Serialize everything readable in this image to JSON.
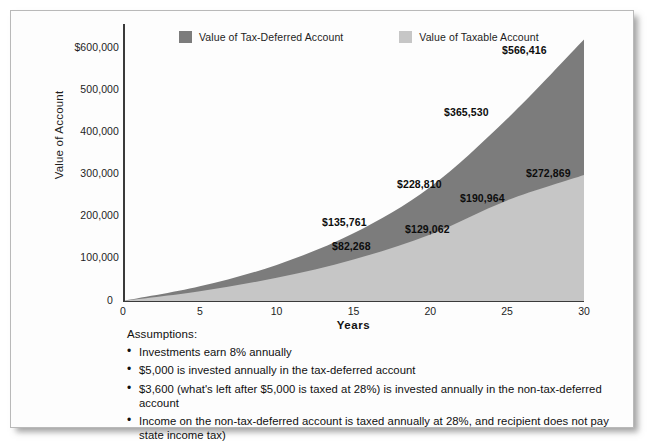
{
  "chart_data": {
    "type": "area",
    "title": "",
    "xlabel": "Years",
    "ylabel": "Value of Account",
    "xlim": [
      0,
      30
    ],
    "ylim": [
      0,
      600000
    ],
    "grid": false,
    "legend_position": "top",
    "x_ticks": [
      "0",
      "5",
      "10",
      "15",
      "20",
      "25",
      "30"
    ],
    "x_tick_values": [
      0,
      5,
      10,
      15,
      20,
      25,
      30
    ],
    "y_ticks": [
      "$600,000",
      "500,000",
      "400,000",
      "300,000",
      "200,000",
      "100,000",
      "0"
    ],
    "y_tick_values": [
      600000,
      500000,
      400000,
      300000,
      200000,
      100000,
      0
    ],
    "series": [
      {
        "name": "Value of Tax-Deferred Account",
        "color": "#7c7c7c",
        "x": [
          0,
          5,
          10,
          15,
          20,
          25,
          30
        ],
        "values": [
          0,
          31680,
          78227,
          146621,
          247115,
          394772,
          566416
        ]
      },
      {
        "name": "Value of Taxable Account",
        "color": "#c6c6c6",
        "x": [
          0,
          5,
          10,
          15,
          20,
          25,
          30
        ],
        "values": [
          0,
          21130,
          50230,
          89860,
          144100,
          217840,
          272869
        ]
      }
    ],
    "annotations": [
      {
        "text": "$566,416",
        "series": "Value of Tax-Deferred Account",
        "x": 30,
        "y": 566416
      },
      {
        "text": "$365,530",
        "series": "Value of Tax-Deferred Account",
        "x": 26,
        "y": 365530
      },
      {
        "text": "$228,810",
        "series": "Value of Tax-Deferred Account",
        "x": 20,
        "y": 228810
      },
      {
        "text": "$135,761",
        "series": "Value of Tax-Deferred Account",
        "x": 15,
        "y": 135761
      },
      {
        "text": "$272,869",
        "series": "Value of Taxable Account",
        "x": 30,
        "y": 272869
      },
      {
        "text": "$190,964",
        "series": "Value of Taxable Account",
        "x": 25,
        "y": 190964
      },
      {
        "text": "$129,062",
        "series": "Value of Taxable Account",
        "x": 20,
        "y": 129062
      },
      {
        "text": "$82,268",
        "series": "Value of Taxable Account",
        "x": 15,
        "y": 82268
      }
    ]
  },
  "legend": {
    "items": [
      {
        "label": "Value of Tax-Deferred Account",
        "color": "#7c7c7c"
      },
      {
        "label": "Value of Taxable Account",
        "color": "#c6c6c6"
      }
    ]
  },
  "axis": {
    "y_title": "Value of Account",
    "x_title": "Years",
    "y_tick_0": "$600,000",
    "y_tick_1": "500,000",
    "y_tick_2": "400,000",
    "y_tick_3": "300,000",
    "y_tick_4": "200,000",
    "y_tick_5": "100,000",
    "y_tick_6": "0",
    "x_tick_0": "0",
    "x_tick_1": "5",
    "x_tick_2": "10",
    "x_tick_3": "15",
    "x_tick_4": "20",
    "x_tick_5": "25",
    "x_tick_6": "30"
  },
  "data_labels": {
    "l_566416": "$566,416",
    "l_365530": "$365,530",
    "l_272869": "$272,869",
    "l_228810": "$228,810",
    "l_190964": "$190,964",
    "l_135761": "$135,761",
    "l_129062": "$129,062",
    "l_82268": "$82,268"
  },
  "assumptions": {
    "title": "Assumptions:",
    "bullet_glyph": "•",
    "items": [
      "Investments earn 8% annually",
      "$5,000 is invested annually in the tax-deferred account",
      "$3,600 (what's left after $5,000 is taxed at 28%) is invested annually in the non-tax-deferred account",
      "Income on the non-tax-deferred account is taxed annually at 28%, and recipient does not pay state income tax)"
    ]
  },
  "colors": {
    "tax_deferred": "#7c7c7c",
    "taxable": "#c6c6c6",
    "axis": "#3a3a3a",
    "text": "#101010",
    "frame": "#b9b9b9"
  }
}
